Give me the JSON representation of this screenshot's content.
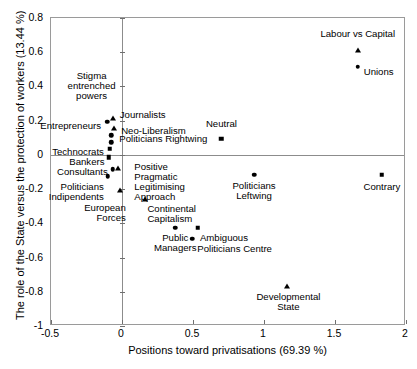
{
  "chart_data": {
    "type": "scatter",
    "title": "",
    "xlabel": "Positions toward privatisations (69.39 %)",
    "ylabel": "The role of the State versus the protection of workers (13.44 %)",
    "xlim": [
      -0.5,
      2
    ],
    "ylim": [
      -1,
      0.8
    ],
    "xticks": [
      "-0.5",
      "0",
      "0.5",
      "1",
      "1.5",
      "2"
    ],
    "xtick_values": [
      -0.5,
      0,
      0.5,
      1,
      1.5,
      2
    ],
    "yticks": [
      "0.8",
      "0.6",
      "0.4",
      "0.2",
      "0",
      "-0.2",
      "-0.4",
      "-0.6",
      "-0.8",
      "-1"
    ],
    "ytick_values": [
      0.8,
      0.6,
      0.4,
      0.2,
      0,
      -0.2,
      -0.4,
      -0.6,
      -0.8,
      -1
    ],
    "grid": false,
    "legend": "none",
    "zero_lines": true,
    "points": [
      {
        "label": "Labour vs Capital",
        "x": 1.66,
        "y": 0.615,
        "marker": "triangle",
        "label_dx": 0,
        "label_dy": -16,
        "align": "center"
      },
      {
        "label": "Unions",
        "x": 1.66,
        "y": 0.515,
        "marker": "circle",
        "label_dx": 6,
        "label_dy": 5,
        "align": "left"
      },
      {
        "label": "Neutral",
        "x": 0.7,
        "y": 0.095,
        "marker": "square",
        "label_dx": 0,
        "label_dy": -15,
        "align": "center"
      },
      {
        "label": "Stigma\nentrenched\npowers",
        "x": -0.2,
        "y": 0.205,
        "marker": "none",
        "label_dx": -2,
        "label_dy": -44,
        "align": "center"
      },
      {
        "label": "Journalists",
        "x": -0.065,
        "y": 0.215,
        "marker": "triangle",
        "label_dx": 7,
        "label_dy": -3,
        "align": "left"
      },
      {
        "label": "Entrepreneurs",
        "x": -0.105,
        "y": 0.195,
        "marker": "circle",
        "label_dx": -6,
        "label_dy": 4,
        "align": "right"
      },
      {
        "label": "Neo-Liberalism",
        "x": -0.055,
        "y": 0.155,
        "marker": "triangle",
        "label_dx": 7,
        "label_dy": 3,
        "align": "left"
      },
      {
        "label": "Politicians Rightwing",
        "x": -0.075,
        "y": 0.115,
        "marker": "circle",
        "label_dx": 8,
        "label_dy": 4,
        "align": "left"
      },
      {
        "label": "Politicians Rightwing Marker",
        "x": -0.075,
        "y": 0.075,
        "marker": "circle",
        "label_dx": 0,
        "label_dy": 0,
        "align": "none"
      },
      {
        "label": "Technocrats",
        "x": -0.085,
        "y": 0.035,
        "marker": "square",
        "label_dx": -6,
        "label_dy": 3,
        "align": "right"
      },
      {
        "label": "Positive\nPragmatic\nLegitimising\nApproach",
        "x": 0.03,
        "y": 0.03,
        "marker": "none",
        "label_dx": 8,
        "label_dy": 17,
        "align": "left"
      },
      {
        "label": "Bankers",
        "x": -0.095,
        "y": -0.015,
        "marker": "square",
        "label_dx": -4,
        "label_dy": 5,
        "align": "right"
      },
      {
        "label": "Consultants",
        "x": -0.065,
        "y": -0.085,
        "marker": "circle",
        "label_dx": -5,
        "label_dy": 3,
        "align": "right"
      },
      {
        "label": "Consultants Marker2",
        "x": -0.03,
        "y": -0.075,
        "marker": "triangle",
        "label_dx": 0,
        "label_dy": 0,
        "align": "none"
      },
      {
        "label": "Politicians\nIndipendents",
        "x": -0.1,
        "y": -0.125,
        "marker": "circle",
        "label_dx": -4,
        "label_dy": 11,
        "align": "right"
      },
      {
        "label": "Indipendents Marker",
        "x": -0.015,
        "y": -0.205,
        "marker": "triangle",
        "label_dx": 0,
        "label_dy": 0,
        "align": "none"
      },
      {
        "label": "European\nForces",
        "x": 0.055,
        "y": -0.255,
        "marker": "none",
        "label_dx": -4,
        "label_dy": 9,
        "align": "right"
      },
      {
        "label": "Continental\nCapitalism",
        "x": 0.165,
        "y": -0.255,
        "marker": "triangle",
        "label_dx": 2,
        "label_dy": 10,
        "align": "left"
      },
      {
        "label": "Public\nManagers",
        "x": 0.375,
        "y": -0.425,
        "marker": "circle",
        "label_dx": 0,
        "label_dy": 10,
        "align": "center"
      },
      {
        "label": "Ambiguous",
        "x": 0.535,
        "y": -0.425,
        "marker": "square",
        "label_dx": 2,
        "label_dy": 10,
        "align": "left"
      },
      {
        "label": "Politicians Centre",
        "x": 0.495,
        "y": -0.49,
        "marker": "circle",
        "label_dx": 5,
        "label_dy": 10,
        "align": "left"
      },
      {
        "label": "Politicians\nLeftwing",
        "x": 0.93,
        "y": -0.115,
        "marker": "circle",
        "label_dx": 0,
        "label_dy": 11,
        "align": "center"
      },
      {
        "label": "Contrary",
        "x": 1.83,
        "y": -0.115,
        "marker": "square",
        "label_dx": 0,
        "label_dy": 12,
        "align": "center"
      },
      {
        "label": "Developmental\nState",
        "x": 1.165,
        "y": -0.765,
        "marker": "triangle",
        "label_dx": 1,
        "label_dy": 11,
        "align": "center"
      }
    ]
  }
}
